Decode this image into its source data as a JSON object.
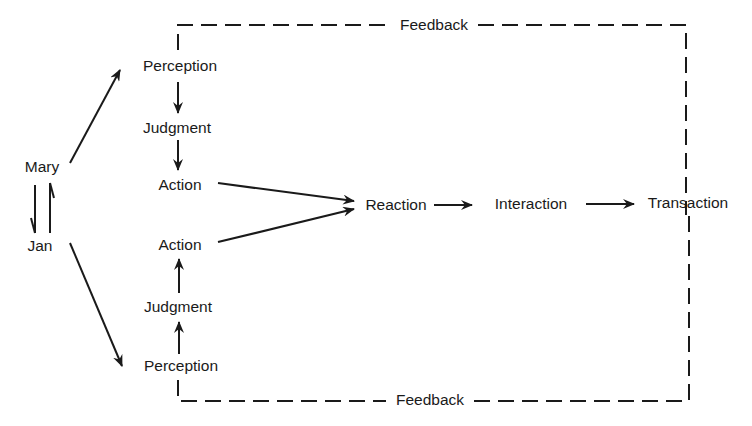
{
  "diagram": {
    "people": {
      "top": "Mary",
      "bottom": "Jan"
    },
    "upper_chain": {
      "perception": "Perception",
      "judgment": "Judgment",
      "action": "Action"
    },
    "lower_chain": {
      "action": "Action",
      "judgment": "Judgment",
      "perception": "Perception"
    },
    "outcome_chain": {
      "reaction": "Reaction",
      "interaction": "Interaction",
      "transaction": "Transaction"
    },
    "feedback": {
      "top_label": "Feedback",
      "bottom_label": "Feedback"
    },
    "colors": {
      "ink": "#1a1a1a",
      "background": "#ffffff"
    }
  }
}
